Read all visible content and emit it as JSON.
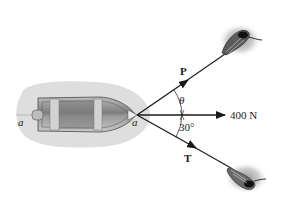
{
  "diagram": {
    "apex_label": "a",
    "stern_label": "a",
    "forces": [
      {
        "id": "P",
        "label": "P",
        "direction": "upper-right"
      },
      {
        "id": "resultant",
        "label": "400 N",
        "direction": "right"
      },
      {
        "id": "T",
        "label": "T",
        "direction": "lower-right"
      }
    ],
    "angles": [
      {
        "id": "theta",
        "label": "θ",
        "between": [
          "P",
          "resultant"
        ]
      },
      {
        "id": "thirty",
        "label": "30°",
        "between": [
          "resultant",
          "T"
        ]
      }
    ],
    "colors": {
      "water_shadow": "#d9d9d9",
      "hull": "#8a8a8a",
      "line": "#1a1a1a",
      "background": "#ffffff"
    }
  }
}
